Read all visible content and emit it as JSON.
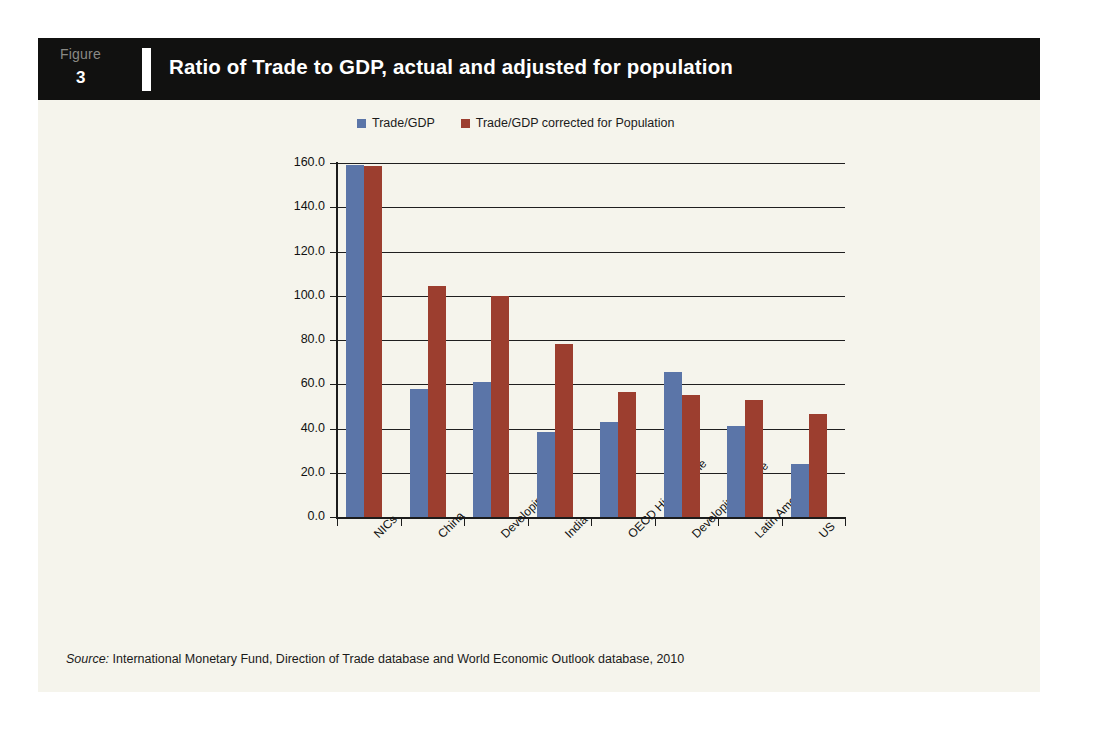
{
  "figure": {
    "label": "Figure",
    "number": "3",
    "title": "Ratio of Trade to GDP, actual and adjusted for population"
  },
  "source": {
    "prefix": "Source:",
    "text": " International Monetary Fund, Direction of Trade database and World Economic Outlook database, 2010"
  },
  "colors": {
    "series1": "#5b75a8",
    "series2": "#9c3e2f",
    "header_bg": "#111110",
    "panel_bg": "#f5f4ec",
    "axis": "#1c1c1c"
  },
  "chart_data": {
    "type": "bar",
    "title": "Ratio of Trade to GDP, actual and adjusted for population",
    "xlabel": "",
    "ylabel": "",
    "ylim": [
      0,
      160
    ],
    "ytick_step": 20,
    "ytick_labels": [
      "0.0",
      "20.0",
      "40.0",
      "60.0",
      "80.0",
      "100.0",
      "120.0",
      "140.0",
      "160.0"
    ],
    "grid": true,
    "legend_position": "top",
    "categories": [
      "NICs",
      "China",
      "Developing Asia",
      "India",
      "OECD High Income",
      "Developing Europe",
      "Latin America",
      "US"
    ],
    "series": [
      {
        "name": "Trade/GDP",
        "color": "#5b75a8",
        "values": [
          159.0,
          58.0,
          61.0,
          38.5,
          43.0,
          65.5,
          41.0,
          24.0
        ]
      },
      {
        "name": "Trade/GDP corrected for Population",
        "color": "#9c3e2f",
        "values": [
          158.5,
          104.5,
          100.0,
          78.0,
          56.5,
          55.0,
          53.0,
          46.5
        ]
      }
    ]
  }
}
